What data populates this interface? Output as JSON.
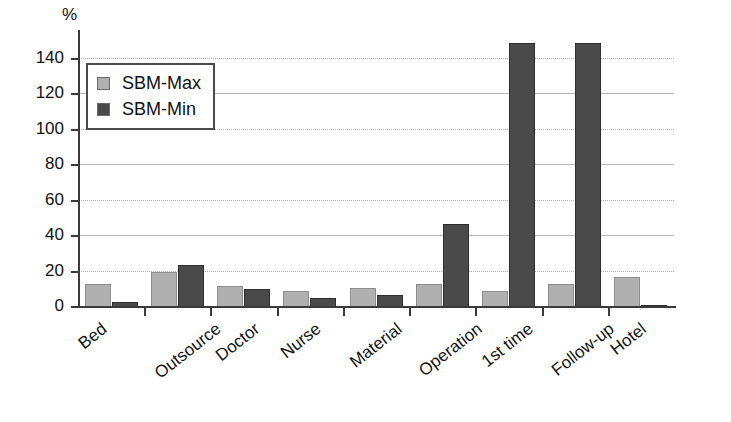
{
  "chart_data": {
    "type": "bar",
    "title": "",
    "subtitle": "",
    "xlabel": "",
    "ylabel": "%",
    "unit_label": "%",
    "ylim": [
      0,
      150
    ],
    "yticks": [
      0,
      20,
      40,
      60,
      80,
      100,
      120,
      140
    ],
    "ytick_labels": [
      "0",
      "20",
      "40",
      "60",
      "80",
      "100",
      "120",
      "140"
    ],
    "grid": true,
    "grid_axis": "y",
    "legend_position": "upper-left-inside",
    "categories": [
      "Bed",
      "Outsource",
      "Doctor",
      "Nurse",
      "Material",
      "Operation",
      "1st time",
      "Follow-up",
      "Hotel"
    ],
    "series": [
      {
        "name": "SBM-Max",
        "color": "#b0b0b0",
        "values": [
          13,
          20,
          12,
          9,
          11,
          13,
          9,
          13,
          17
        ]
      },
      {
        "name": "SBM-Min",
        "color": "#4a4a4a",
        "values": [
          3,
          24,
          10,
          5,
          7,
          47,
          149,
          149,
          1
        ]
      }
    ],
    "annotations": []
  },
  "legend": {
    "items": [
      {
        "label": "SBM-Max",
        "swatch": "series-max"
      },
      {
        "label": "SBM-Min",
        "swatch": "series-min"
      }
    ]
  }
}
